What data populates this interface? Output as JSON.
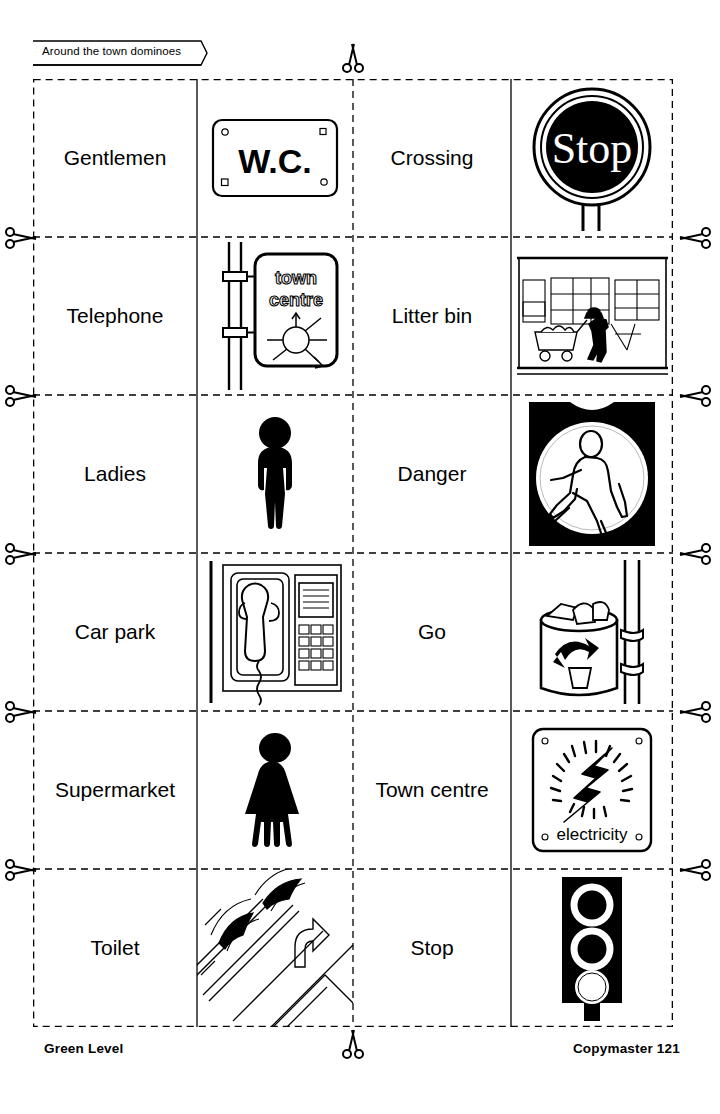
{
  "header": {
    "title": "Around the town dominoes"
  },
  "footer": {
    "left_label": "Green Level",
    "right_label": "Copymaster 121",
    "scissors_icon": "scissors-icon"
  },
  "sheet": {
    "rows": 6,
    "columns": 4,
    "column_kinds": [
      "label",
      "picture",
      "label",
      "picture"
    ],
    "cut_line_style": "dashed",
    "domino_divider_style": "solid",
    "dominoes": [
      {
        "row": 1,
        "left_label": "Gentlemen",
        "left_picture": "wc-sign-icon",
        "right_label": "Crossing",
        "right_picture": "stop-round-sign-icon"
      },
      {
        "row": 2,
        "left_label": "Telephone",
        "left_picture": "town-centre-sign-icon",
        "right_label": "Litter bin",
        "right_picture": "supermarket-scene-icon"
      },
      {
        "row": 3,
        "left_label": "Ladies",
        "left_picture": "man-pictogram-icon",
        "right_label": "Danger",
        "right_picture": "pedestrian-crossing-light-icon"
      },
      {
        "row": 4,
        "left_label": "Car park",
        "left_picture": "payphone-icon",
        "right_label": "Go",
        "right_picture": "litter-bin-icon"
      },
      {
        "row": 5,
        "left_label": "Supermarket",
        "left_picture": "woman-pictogram-icon",
        "right_label": "Town centre",
        "right_picture": "electricity-sign-icon"
      },
      {
        "row": 6,
        "left_label": "Toilet",
        "left_picture": "car-park-markings-icon",
        "right_label": "Stop",
        "right_picture": "traffic-light-icon"
      }
    ]
  },
  "picture_text": {
    "wc_sign": "W.C.",
    "stop_sign": "Stop",
    "town_centre_line1": "town",
    "town_centre_line2": "centre",
    "electricity_sign": "electricity"
  },
  "colors": {
    "ink": "#000000",
    "paper": "#ffffff"
  }
}
